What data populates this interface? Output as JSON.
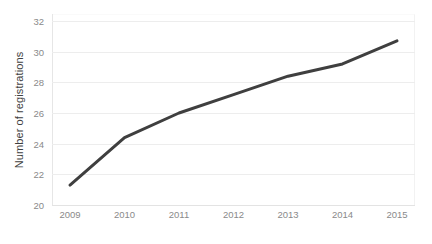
{
  "chart_data": {
    "type": "line",
    "title": "",
    "subtitle": "",
    "xlabel": "",
    "ylabel": "Number of registrations",
    "categories": [
      "2009",
      "2010",
      "2011",
      "2012",
      "2013",
      "2014",
      "2015"
    ],
    "x": [
      2009,
      2010,
      2011,
      2012,
      2013,
      2014,
      2015
    ],
    "values": [
      21.3,
      24.4,
      26.0,
      27.2,
      28.4,
      29.2,
      30.7
    ],
    "series": [
      {
        "name": "Number of registrations",
        "values": [
          21.3,
          24.4,
          26.0,
          27.2,
          28.4,
          29.2,
          30.7
        ],
        "color": "#3f3f3f",
        "line_width": 3,
        "markers": false
      }
    ],
    "ylim": [
      20,
      32
    ],
    "yticks": [
      20,
      22,
      24,
      26,
      28,
      30,
      32
    ],
    "ytick_labels": [
      "20",
      "22",
      "24",
      "26",
      "28",
      "30",
      "32"
    ],
    "xtick_labels": [
      "2009",
      "2010",
      "2011",
      "2012",
      "2013",
      "2014",
      "2015"
    ],
    "grid": {
      "horizontal": true,
      "vertical": false,
      "color": "#ededed"
    },
    "legend": {
      "visible": false,
      "position": "none",
      "entries": []
    },
    "annotations": [],
    "axis_colors": {
      "axis_line": "#e3e3e3",
      "tick_label": "#8a8a8a",
      "axis_title": "#3f3f3f",
      "background": "#ffffff"
    }
  }
}
